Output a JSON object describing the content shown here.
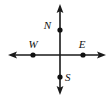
{
  "figure": {
    "background_color": "#ffffff",
    "stroke_color": "#1a1a1a",
    "point_color": "#111111",
    "label_color": "#111111",
    "width": 112,
    "height": 99,
    "origin": {
      "x": 60,
      "y": 55
    },
    "axes": {
      "vertical": {
        "name": "vertical-axis",
        "x": 60,
        "y_top": 5,
        "y_bottom": 94,
        "arrow_top": true,
        "arrow_bottom": true
      },
      "horizontal": {
        "name": "horizontal-axis",
        "y": 55,
        "x_left": 9,
        "x_right": 105,
        "arrow_left": true,
        "arrow_right": true
      }
    },
    "points": [
      {
        "id": "point-n",
        "label": "N",
        "x": 60,
        "y": 30,
        "label_x": 51,
        "label_y": 29,
        "label_anchor": "end",
        "label_position": "left"
      },
      {
        "id": "point-w",
        "label": "W",
        "x": 33,
        "y": 55,
        "label_x": 33,
        "label_y": 48,
        "label_anchor": "middle",
        "label_position": "above"
      },
      {
        "id": "point-e",
        "label": "E",
        "x": 83,
        "y": 55,
        "label_x": 82,
        "label_y": 48,
        "label_anchor": "middle",
        "label_position": "above"
      },
      {
        "id": "point-s",
        "label": "S",
        "x": 60,
        "y": 77,
        "label_x": 65,
        "label_y": 81,
        "label_anchor": "start",
        "label_position": "right"
      }
    ],
    "point_radius": 2.4,
    "arrow_size": {
      "width": 5,
      "length": 7
    }
  }
}
